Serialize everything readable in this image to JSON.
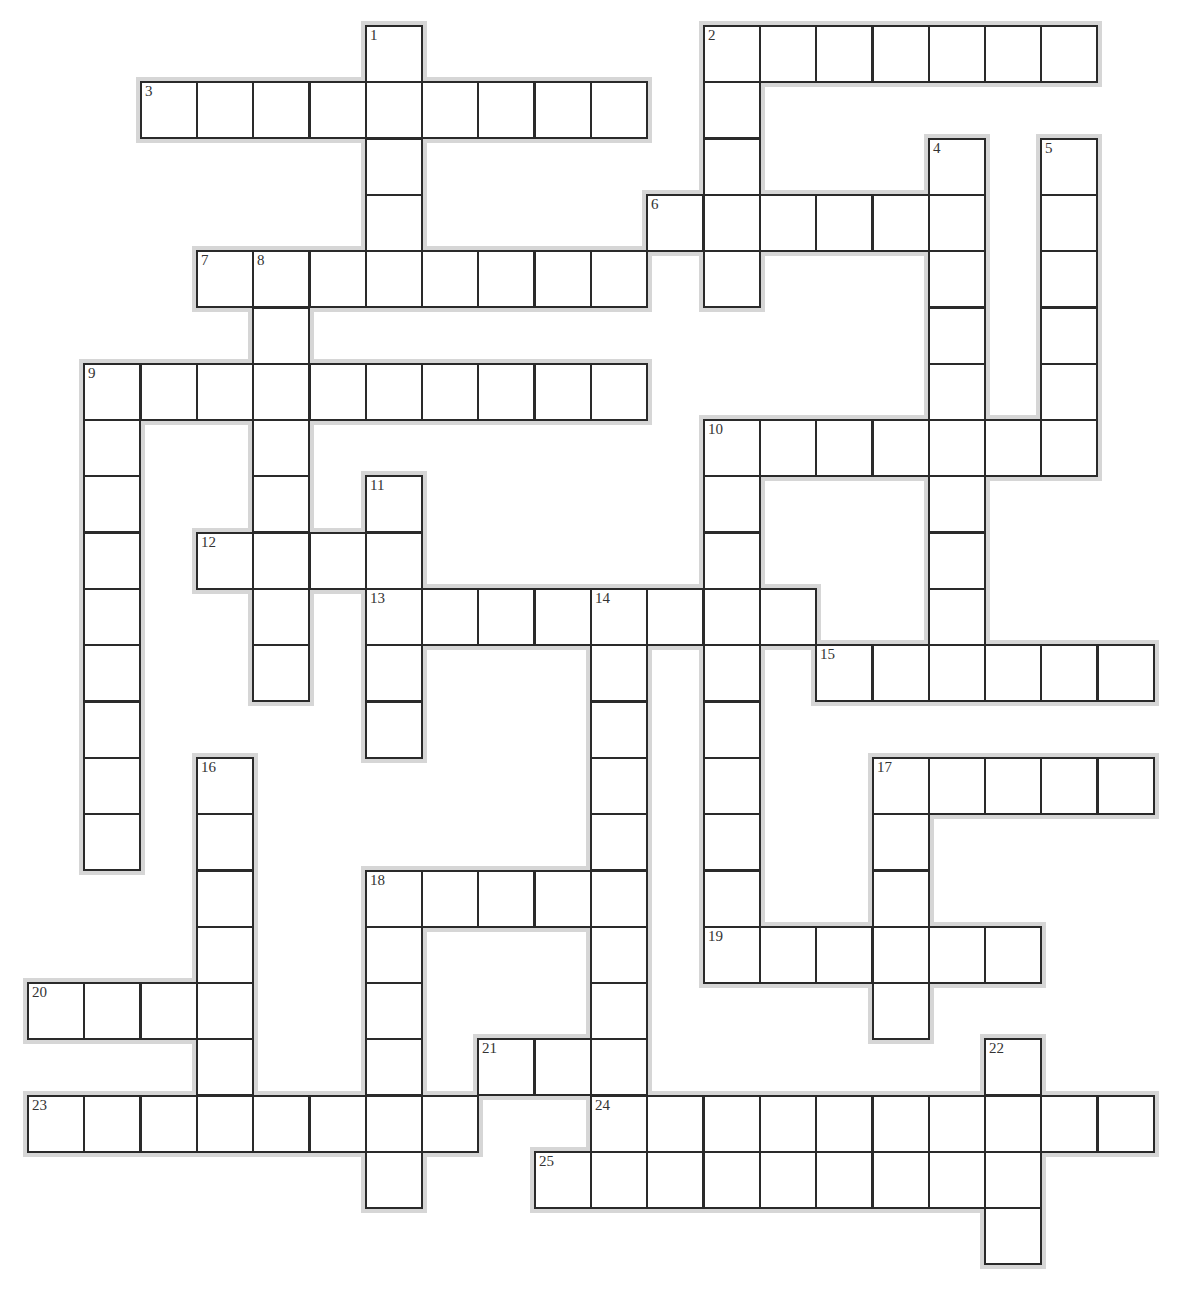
{
  "puzzle": {
    "type": "crossword",
    "grid": {
      "cell_size": 56.3,
      "origin_x": 27,
      "origin_y": 25,
      "columns": 20,
      "rows": 22
    },
    "colors": {
      "border": "#2a2a2a",
      "shadow": "#d6d6d6",
      "cell_fill": "#ffffff",
      "number": "#333333"
    },
    "entries": [
      {
        "number": "1",
        "direction": "down",
        "col": 6,
        "row": 0,
        "length": 5
      },
      {
        "number": "2",
        "direction": "across",
        "col": 12,
        "row": 0,
        "length": 7
      },
      {
        "number": "2",
        "direction": "down",
        "col": 12,
        "row": 0,
        "length": 5
      },
      {
        "number": "3",
        "direction": "across",
        "col": 2,
        "row": 1,
        "length": 9
      },
      {
        "number": "4",
        "direction": "down",
        "col": 16,
        "row": 2,
        "length": 9
      },
      {
        "number": "5",
        "direction": "down",
        "col": 18,
        "row": 2,
        "length": 6
      },
      {
        "number": "6",
        "direction": "across",
        "col": 11,
        "row": 3,
        "length": 6
      },
      {
        "number": "7",
        "direction": "across",
        "col": 3,
        "row": 4,
        "length": 8
      },
      {
        "number": "8",
        "direction": "down",
        "col": 4,
        "row": 4,
        "length": 8
      },
      {
        "number": "9",
        "direction": "across",
        "col": 1,
        "row": 6,
        "length": 10
      },
      {
        "number": "9",
        "direction": "down",
        "col": 1,
        "row": 6,
        "length": 9
      },
      {
        "number": "10",
        "direction": "across",
        "col": 12,
        "row": 7,
        "length": 7
      },
      {
        "number": "10",
        "direction": "down",
        "col": 12,
        "row": 7,
        "length": 9
      },
      {
        "number": "11",
        "direction": "down",
        "col": 6,
        "row": 8,
        "length": 5
      },
      {
        "number": "12",
        "direction": "across",
        "col": 3,
        "row": 9,
        "length": 4
      },
      {
        "number": "13",
        "direction": "across",
        "col": 6,
        "row": 10,
        "length": 8
      },
      {
        "number": "14",
        "direction": "down",
        "col": 10,
        "row": 10,
        "length": 9
      },
      {
        "number": "15",
        "direction": "across",
        "col": 14,
        "row": 11,
        "length": 6
      },
      {
        "number": "16",
        "direction": "down",
        "col": 3,
        "row": 13,
        "length": 6
      },
      {
        "number": "17",
        "direction": "across",
        "col": 15,
        "row": 13,
        "length": 5
      },
      {
        "number": "17",
        "direction": "down",
        "col": 15,
        "row": 13,
        "length": 5
      },
      {
        "number": "18",
        "direction": "across",
        "col": 6,
        "row": 15,
        "length": 5
      },
      {
        "number": "18",
        "direction": "down",
        "col": 6,
        "row": 15,
        "length": 6
      },
      {
        "number": "19",
        "direction": "across",
        "col": 12,
        "row": 16,
        "length": 6
      },
      {
        "number": "20",
        "direction": "across",
        "col": 0,
        "row": 17,
        "length": 4
      },
      {
        "number": "21",
        "direction": "across",
        "col": 8,
        "row": 18,
        "length": 3
      },
      {
        "number": "22",
        "direction": "down",
        "col": 17,
        "row": 18,
        "length": 4
      },
      {
        "number": "23",
        "direction": "across",
        "col": 0,
        "row": 19,
        "length": 8
      },
      {
        "number": "24",
        "direction": "across",
        "col": 10,
        "row": 19,
        "length": 10
      },
      {
        "number": "25",
        "direction": "across",
        "col": 9,
        "row": 20,
        "length": 9
      }
    ],
    "clue_numbers": [
      "1",
      "2",
      "3",
      "4",
      "5",
      "6",
      "7",
      "8",
      "9",
      "10",
      "11",
      "12",
      "13",
      "14",
      "15",
      "16",
      "17",
      "18",
      "19",
      "20",
      "21",
      "22",
      "23",
      "24",
      "25"
    ]
  }
}
